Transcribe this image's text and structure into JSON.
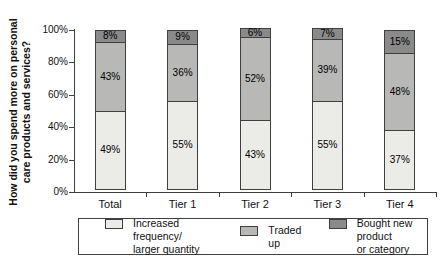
{
  "chart_data": {
    "type": "bar",
    "stacked": true,
    "title": "",
    "xlabel": "",
    "ylabel": "How did you spend more on personal care products and services?",
    "ylabel_lines": [
      "How did you spend more on personal",
      "care products and services?"
    ],
    "categories": [
      "Total",
      "Tier 1",
      "Tier 2",
      "Tier 3",
      "Tier 4"
    ],
    "series": [
      {
        "name": "Increased frequency/ larger quantity",
        "values": [
          49,
          55,
          43,
          55,
          37
        ],
        "color": "#ebebe8"
      },
      {
        "name": "Traded up",
        "values": [
          43,
          36,
          52,
          39,
          48
        ],
        "color": "#b8b8b6"
      },
      {
        "name": "Bought new product or category",
        "values": [
          8,
          9,
          6,
          7,
          15
        ],
        "color": "#8a8a8a"
      }
    ],
    "bar_label_format": "{v}%",
    "yticks": [
      "0%",
      "20%",
      "40%",
      "60%",
      "80%",
      "100%"
    ],
    "ylim": [
      0,
      100
    ],
    "grid": false,
    "legend_position": "bottom",
    "legend": [
      {
        "label": "Increased frequency/\nlarger quantity",
        "color": "#ebebe8"
      },
      {
        "label": "Traded up",
        "color": "#b8b8b6"
      },
      {
        "label": "Bought new product\nor category",
        "color": "#8a8a8a"
      }
    ],
    "colors": {
      "segment_border": "#3f3f3f",
      "axis": "#3f3f3f",
      "label_text": "#000000"
    }
  }
}
